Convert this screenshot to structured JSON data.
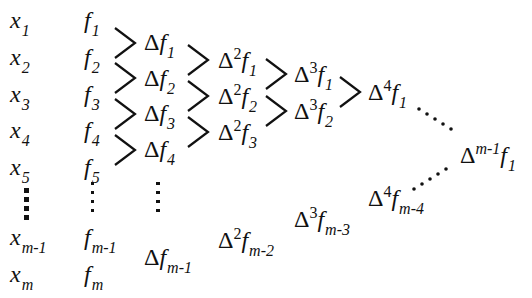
{
  "diagram": {
    "columns": [
      {
        "name": "x",
        "entries": [
          {
            "base": "x",
            "sub": "1"
          },
          {
            "base": "x",
            "sub": "2"
          },
          {
            "base": "x",
            "sub": "3"
          },
          {
            "base": "x",
            "sub": "4"
          },
          {
            "base": "x",
            "sub": "5"
          },
          {
            "base": "x",
            "sub": "m-1"
          },
          {
            "base": "x",
            "sub": "m"
          }
        ]
      },
      {
        "name": "f",
        "entries": [
          {
            "base": "f",
            "sub": "1"
          },
          {
            "base": "f",
            "sub": "2"
          },
          {
            "base": "f",
            "sub": "3"
          },
          {
            "base": "f",
            "sub": "4"
          },
          {
            "base": "f",
            "sub": "5"
          },
          {
            "base": "f",
            "sub": "m-1"
          },
          {
            "base": "f",
            "sub": "m"
          }
        ]
      },
      {
        "name": "delta1",
        "entries": [
          {
            "delta": "Δ",
            "base": "f",
            "sub": "1"
          },
          {
            "delta": "Δ",
            "base": "f",
            "sub": "2"
          },
          {
            "delta": "Δ",
            "base": "f",
            "sub": "3"
          },
          {
            "delta": "Δ",
            "base": "f",
            "sub": "4"
          },
          {
            "delta": "Δ",
            "base": "f",
            "sub": "m-1"
          }
        ]
      },
      {
        "name": "delta2",
        "entries": [
          {
            "delta": "Δ",
            "sup": "2",
            "base": "f",
            "sub": "1"
          },
          {
            "delta": "Δ",
            "sup": "2",
            "base": "f",
            "sub": "2"
          },
          {
            "delta": "Δ",
            "sup": "2",
            "base": "f",
            "sub": "3"
          },
          {
            "delta": "Δ",
            "sup": "2",
            "base": "f",
            "sub": "m-2"
          }
        ]
      },
      {
        "name": "delta3",
        "entries": [
          {
            "delta": "Δ",
            "sup": "3",
            "base": "f",
            "sub": "1"
          },
          {
            "delta": "Δ",
            "sup": "3",
            "base": "f",
            "sub": "2"
          },
          {
            "delta": "Δ",
            "sup": "3",
            "base": "f",
            "sub": "m-3"
          }
        ]
      },
      {
        "name": "delta4",
        "entries": [
          {
            "delta": "Δ",
            "sup": "4",
            "base": "f",
            "sub": "1"
          },
          {
            "delta": "Δ",
            "sup": "4",
            "base": "f",
            "sub": "m-4"
          }
        ]
      },
      {
        "name": "deltaM1",
        "entries": [
          {
            "delta": "Δ",
            "sup": "m-1",
            "base": "f",
            "sub": "1"
          }
        ]
      }
    ],
    "connectors": "chevron",
    "ellipsis_glyph": "⋮"
  }
}
